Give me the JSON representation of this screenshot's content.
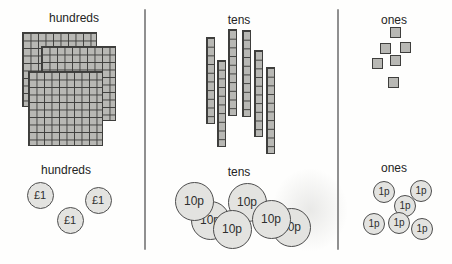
{
  "background": "#fefefd",
  "colors": {
    "block_fill": "#b8b8b4",
    "block_border": "#3e3e3c",
    "coin_fill": "#e3e3e0",
    "coin_border": "#4d4d4d",
    "coin_text": "#2e2e2e",
    "label_text": "#242424",
    "divider": "#909090"
  },
  "dividers": [
    {
      "x": 144,
      "y1": 9,
      "y2": 250
    },
    {
      "x": 337,
      "y1": 9,
      "y2": 250
    }
  ],
  "columns": [
    {
      "id": "hundreds",
      "top_label": {
        "text": "hundreds",
        "cx": 74,
        "y": 11
      },
      "bottom_label": {
        "text": "hundreds",
        "cx": 66,
        "y": 163
      },
      "blocks": {
        "name": "hundred-flat-block",
        "rows": 10,
        "cols": 10,
        "cell": 7.5,
        "items": [
          {
            "x": 22,
            "y": 32
          },
          {
            "x": 41,
            "y": 46
          },
          {
            "x": 28,
            "y": 71
          }
        ]
      },
      "coins": {
        "name": "one-pound-coin",
        "label": "£1",
        "radius": 13.5,
        "font": 11,
        "items": [
          {
            "cx": 40,
            "cy": 195
          },
          {
            "cx": 98,
            "cy": 200
          },
          {
            "cx": 70,
            "cy": 220
          }
        ]
      }
    },
    {
      "id": "tens",
      "top_label": {
        "text": "tens",
        "cx": 239,
        "y": 13
      },
      "bottom_label": {
        "text": "tens",
        "cx": 239,
        "y": 165
      },
      "blocks": {
        "name": "ten-rod-block",
        "rows": 10,
        "cols": 1,
        "cell": 8.7,
        "items": [
          {
            "x": 206,
            "y": 37
          },
          {
            "x": 217,
            "y": 60
          },
          {
            "x": 228,
            "y": 29
          },
          {
            "x": 242,
            "y": 30
          },
          {
            "x": 254,
            "y": 50
          },
          {
            "x": 266,
            "y": 67
          }
        ]
      },
      "coins": {
        "name": "ten-pence-coin",
        "label": "10p",
        "radius": 19.5,
        "font": 12,
        "items": [
          {
            "cx": 210,
            "cy": 220
          },
          {
            "cx": 247,
            "cy": 202
          },
          {
            "cx": 291,
            "cy": 227
          },
          {
            "cx": 194,
            "cy": 201
          },
          {
            "cx": 271,
            "cy": 219
          },
          {
            "cx": 232,
            "cy": 229
          }
        ]
      }
    },
    {
      "id": "ones",
      "top_label": {
        "text": "ones",
        "cx": 394,
        "y": 13
      },
      "bottom_label": {
        "text": "ones",
        "cx": 394,
        "y": 161
      },
      "blocks": {
        "name": "one-unit-block",
        "rows": 1,
        "cols": 1,
        "cell": 11,
        "items": [
          {
            "x": 390,
            "y": 27
          },
          {
            "x": 380,
            "y": 43
          },
          {
            "x": 400,
            "y": 42
          },
          {
            "x": 372,
            "y": 58
          },
          {
            "x": 390,
            "y": 55
          },
          {
            "x": 388,
            "y": 77
          }
        ]
      },
      "coins": {
        "name": "one-penny-coin",
        "label": "1p",
        "radius": 11,
        "font": 10,
        "items": [
          {
            "cx": 384,
            "cy": 192
          },
          {
            "cx": 421,
            "cy": 191
          },
          {
            "cx": 405,
            "cy": 206
          },
          {
            "cx": 422,
            "cy": 229
          },
          {
            "cx": 374,
            "cy": 224
          },
          {
            "cx": 399,
            "cy": 223
          }
        ]
      }
    }
  ]
}
